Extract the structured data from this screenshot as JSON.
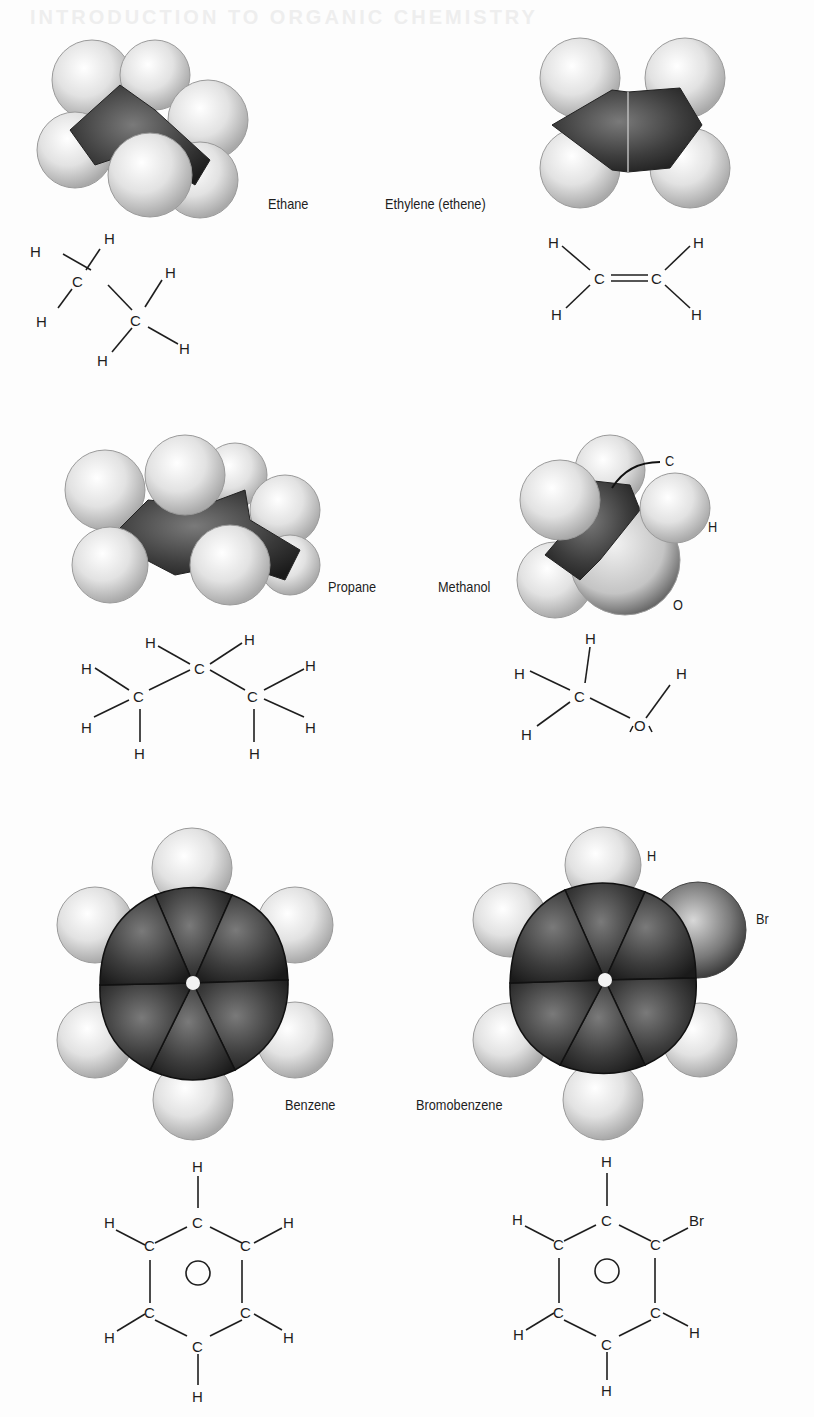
{
  "page": {
    "bleed_through_header": "INTRODUCTION TO ORGANIC CHEMISTRY"
  },
  "molecules": [
    {
      "name": "Ethane",
      "model": "space-filling",
      "formula_atoms": [
        "H",
        "H",
        "H",
        "C",
        "C",
        "H",
        "H",
        "H"
      ]
    },
    {
      "name": "Ethylene (ethene)",
      "model": "space-filling",
      "formula_atoms": [
        "H",
        "H",
        "C",
        "C",
        "H",
        "H"
      ],
      "bond": "double"
    },
    {
      "name": "Propane",
      "model": "space-filling",
      "formula_atoms": [
        "H",
        "H",
        "H",
        "C",
        "C",
        "C",
        "H",
        "H",
        "H",
        "H",
        "H"
      ]
    },
    {
      "name": "Methanol",
      "model": "space-filling",
      "callouts": [
        "C",
        "H",
        "O"
      ],
      "formula_atoms": [
        "H",
        "H",
        "H",
        "C",
        "O",
        "H"
      ]
    },
    {
      "name": "Benzene",
      "model": "space-filling",
      "formula_atoms": [
        "H",
        "C",
        "H",
        "C",
        "C",
        "H",
        "C",
        "C",
        "H",
        "C",
        "H"
      ]
    },
    {
      "name": "Bromobenzene",
      "model": "space-filling",
      "callouts": [
        "H",
        "Br"
      ],
      "formula_atoms": [
        "H",
        "C",
        "Br",
        "C",
        "C",
        "H",
        "C",
        "C",
        "H",
        "C",
        "H"
      ]
    }
  ],
  "labels": {
    "ethane": "Ethane",
    "ethylene": "Ethylene (ethene)",
    "propane": "Propane",
    "methanol": "Methanol",
    "methanol_c": "C",
    "methanol_h": "H",
    "methanol_o": "O",
    "benzene": "Benzene",
    "bromobenzene": "Bromobenzene",
    "bromo_h": "H",
    "bromo_br": "Br"
  },
  "colors": {
    "hydrogen": "#e4e4e4",
    "carbon": "#3a3a3a",
    "oxygen": "#c9c9c9",
    "bromine": "#8a8a8a",
    "ink": "#1e1e1e"
  }
}
